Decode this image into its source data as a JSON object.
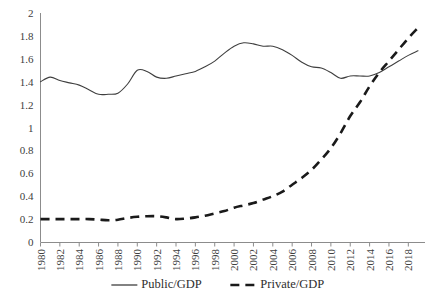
{
  "chart_data": {
    "type": "line",
    "title": "",
    "xlabel": "",
    "ylabel": "",
    "xlim": [
      1980,
      2019
    ],
    "ylim": [
      0,
      2
    ],
    "grid": false,
    "legend_position": "bottom",
    "y_ticks": [
      "0",
      "0.2",
      "0.4",
      "0.6",
      "0.8",
      "1",
      "1.2",
      "1.4",
      "1.6",
      "1.8",
      "2"
    ],
    "y_tick_values": [
      0,
      0.2,
      0.4,
      0.6,
      0.8,
      1,
      1.2,
      1.4,
      1.6,
      1.8,
      2
    ],
    "x_ticks": [
      "1980",
      "1982",
      "1984",
      "1986",
      "1988",
      "1990",
      "1992",
      "1994",
      "1996",
      "1998",
      "2000",
      "2002",
      "2004",
      "2006",
      "2008",
      "2010",
      "2012",
      "2014",
      "2016",
      "2018"
    ],
    "x_tick_values": [
      1980,
      1982,
      1984,
      1986,
      1988,
      1990,
      1992,
      1994,
      1996,
      1998,
      2000,
      2002,
      2004,
      2006,
      2008,
      2010,
      2012,
      2014,
      2016,
      2018
    ],
    "x": [
      1980,
      1981,
      1982,
      1983,
      1984,
      1985,
      1986,
      1987,
      1988,
      1989,
      1990,
      1991,
      1992,
      1993,
      1994,
      1995,
      1996,
      1997,
      1998,
      1999,
      2000,
      2001,
      2002,
      2003,
      2004,
      2005,
      2006,
      2007,
      2008,
      2009,
      2010,
      2011,
      2012,
      2013,
      2014,
      2015,
      2016,
      2017,
      2018,
      2019
    ],
    "series": [
      {
        "name": "Public/GDP",
        "style": "solid",
        "color": "#3f3f3f",
        "values": [
          1.4,
          1.44,
          1.41,
          1.39,
          1.37,
          1.33,
          1.29,
          1.29,
          1.3,
          1.38,
          1.5,
          1.49,
          1.44,
          1.43,
          1.45,
          1.47,
          1.49,
          1.53,
          1.58,
          1.65,
          1.71,
          1.74,
          1.73,
          1.71,
          1.71,
          1.68,
          1.63,
          1.57,
          1.53,
          1.52,
          1.48,
          1.43,
          1.45,
          1.45,
          1.45,
          1.48,
          1.53,
          1.58,
          1.63,
          1.67
        ]
      },
      {
        "name": "Private/GDP",
        "style": "dashed",
        "color": "#1a1a1a",
        "values": [
          0.2,
          0.2,
          0.2,
          0.2,
          0.2,
          0.2,
          0.195,
          0.19,
          0.195,
          0.21,
          0.22,
          0.225,
          0.225,
          0.215,
          0.2,
          0.205,
          0.215,
          0.23,
          0.25,
          0.27,
          0.3,
          0.32,
          0.34,
          0.37,
          0.4,
          0.44,
          0.5,
          0.56,
          0.63,
          0.72,
          0.82,
          0.95,
          1.1,
          1.22,
          1.36,
          1.48,
          1.58,
          1.68,
          1.78,
          1.87
        ]
      }
    ],
    "legend": [
      {
        "label": "Public/GDP",
        "style": "solid"
      },
      {
        "label": "Private/GDP",
        "style": "dashed"
      }
    ]
  }
}
